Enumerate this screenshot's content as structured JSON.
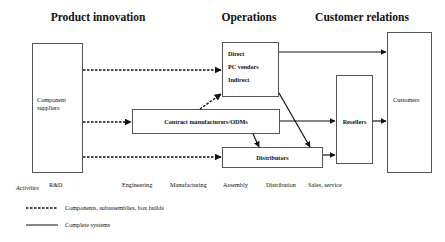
{
  "headers": {
    "product_innovation": "Product innovation",
    "operations": "Operations",
    "customer_relations": "Customer relations"
  },
  "nodes": {
    "component_suppliers": {
      "line1": "Component",
      "line2": "suppliers"
    },
    "pc_vendors": {
      "direct": "Direct",
      "title": "PC vendors",
      "indirect": "Indirect"
    },
    "contract_manufacturers": "Contract manufacturers/ODMs",
    "distributors": "Distributors",
    "resellers": "Resellers",
    "customers": "Customers"
  },
  "activities": {
    "label": "Activities",
    "items": [
      "R&D",
      "Engineering",
      "Manufacturing",
      "Assembly",
      "Distribution",
      "Sales, service"
    ]
  },
  "edges": [
    {
      "from": "component_suppliers",
      "to": "pc_vendors",
      "style": "dashed"
    },
    {
      "from": "component_suppliers",
      "to": "contract_manufacturers",
      "style": "dashed"
    },
    {
      "from": "component_suppliers",
      "to": "distributors",
      "style": "dashed"
    },
    {
      "from": "contract_manufacturers",
      "to": "pc_vendors",
      "style": "dashed"
    },
    {
      "from": "contract_manufacturers",
      "to": "resellers",
      "style": "solid"
    },
    {
      "from": "contract_manufacturers",
      "to": "distributors",
      "style": "solid"
    },
    {
      "from": "pc_vendors",
      "to": "customers",
      "style": "solid"
    },
    {
      "from": "pc_vendors",
      "to": "distributors",
      "style": "solid"
    },
    {
      "from": "distributors",
      "to": "resellers",
      "style": "solid"
    },
    {
      "from": "resellers",
      "to": "customers",
      "style": "solid"
    }
  ],
  "legend": {
    "dashed": "Components, subassemblies, box builds",
    "solid": "Complete systems"
  }
}
